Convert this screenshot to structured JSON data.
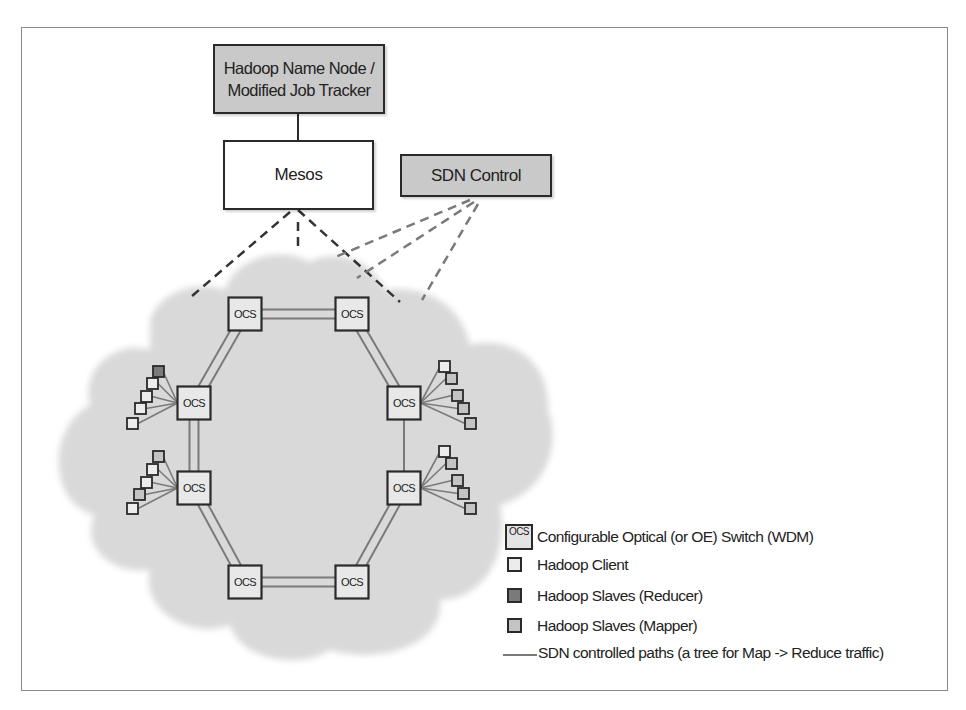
{
  "diagram": {
    "nodes": {
      "namenode": {
        "line1": "Hadoop Name Node /",
        "line2": "Modified Job Tracker"
      },
      "mesos": {
        "label": "Mesos"
      },
      "sdn": {
        "label": "SDN Control"
      }
    },
    "ocs_label": "OCS",
    "ocs_switches": [
      {
        "id": "ocs-top-left",
        "label": "OCS"
      },
      {
        "id": "ocs-top-right",
        "label": "OCS"
      },
      {
        "id": "ocs-mid-left-upper",
        "label": "OCS"
      },
      {
        "id": "ocs-mid-right-upper",
        "label": "OCS"
      },
      {
        "id": "ocs-mid-left-lower",
        "label": "OCS"
      },
      {
        "id": "ocs-mid-right-lower",
        "label": "OCS"
      },
      {
        "id": "ocs-bottom-left",
        "label": "OCS"
      },
      {
        "id": "ocs-bottom-right",
        "label": "OCS"
      }
    ],
    "host_clusters": [
      {
        "attached_to": "ocs-mid-left-upper",
        "hosts": [
          "reducer",
          "client",
          "client",
          "client",
          "client"
        ]
      },
      {
        "attached_to": "ocs-mid-left-lower",
        "hosts": [
          "mapper",
          "client",
          "client",
          "mapper",
          "client"
        ]
      },
      {
        "attached_to": "ocs-mid-right-upper",
        "hosts": [
          "client",
          "mapper",
          "mapper",
          "mapper",
          "mapper"
        ]
      },
      {
        "attached_to": "ocs-mid-right-lower",
        "hosts": [
          "client",
          "mapper",
          "mapper",
          "mapper",
          "mapper"
        ]
      }
    ],
    "colors": {
      "cloud": "#d9d9d9",
      "box_gray": "#c9c9c9",
      "client": "#ececec",
      "reducer": "#7a7a7a",
      "mapper": "#c4c4c4",
      "border": "#2a2a2a",
      "dash_dark": "#333333",
      "dash_light": "#777777",
      "path_line": "#7a7a7a"
    }
  },
  "legend": {
    "ocs_icon_label": "OCS",
    "items": [
      {
        "key": "ocs",
        "label": "Configurable Optical (or OE) Switch (WDM)"
      },
      {
        "key": "client",
        "label": "Hadoop Client"
      },
      {
        "key": "reducer",
        "label": "Hadoop Slaves (Reducer)"
      },
      {
        "key": "mapper",
        "label": "Hadoop Slaves (Mapper)"
      },
      {
        "key": "path",
        "label": "SDN controlled paths (a tree for Map -> Reduce traffic)"
      }
    ]
  }
}
